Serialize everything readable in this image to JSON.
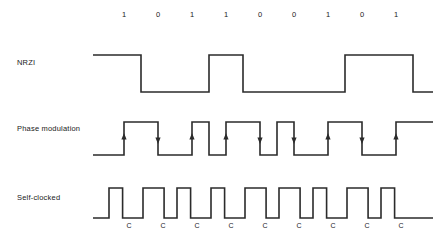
{
  "diagram": {
    "bit_sequence": [
      "1",
      "0",
      "1",
      "1",
      "0",
      "0",
      "1",
      "0",
      "1"
    ],
    "rows": [
      {
        "key": "nrzi",
        "label": "NRZI"
      },
      {
        "key": "phase",
        "label": "Phase modulation"
      },
      {
        "key": "self",
        "label": "Self-clocked"
      }
    ],
    "clock_marks": [
      "C",
      "C",
      "C",
      "C",
      "C",
      "C",
      "C",
      "C",
      "C"
    ],
    "colors": {
      "waveform": "#2b2b2b",
      "text": "#1a1a1a",
      "background": "#ffffff"
    }
  },
  "chart_data": {
    "type": "line",
    "xlabel": "",
    "ylabel": "",
    "grid": false,
    "legend": "none",
    "bit_period_px": 34,
    "first_bit_center_px": 124,
    "categories": [
      "1",
      "0",
      "1",
      "1",
      "0",
      "0",
      "1",
      "0",
      "1"
    ],
    "series": [
      {
        "name": "NRZI",
        "encoding": "transition at each 1 bit, no transition for 0",
        "baseline_y_px": 92,
        "high_y_px": 55,
        "levels": [
          1,
          0,
          0,
          1,
          0,
          0,
          0,
          1,
          1,
          0
        ],
        "transitions_px": [
          124,
          192,
          226,
          328,
          396
        ]
      },
      {
        "name": "Phase modulation",
        "encoding": "mid-bit transition: rising edge for 1, falling edge for 0",
        "baseline_y_px": 155,
        "high_y_px": 122,
        "arrow_directions": [
          "up",
          "down",
          "up",
          "up",
          "down",
          "down",
          "up",
          "down",
          "up"
        ],
        "arrow_x_px": [
          124,
          158,
          192,
          226,
          260,
          294,
          328,
          362,
          396
        ]
      },
      {
        "name": "Self-clocked",
        "encoding": "clock pulse every bit cell; narrow pulse for 1, wide pulse for 0",
        "baseline_y_px": 218,
        "high_y_px": 188,
        "pulse_widths": [
          "narrow",
          "wide",
          "narrow",
          "narrow",
          "wide",
          "wide",
          "narrow",
          "wide",
          "narrow"
        ],
        "clock_x_px": [
          124,
          158,
          192,
          226,
          260,
          294,
          328,
          362,
          396
        ]
      }
    ]
  }
}
